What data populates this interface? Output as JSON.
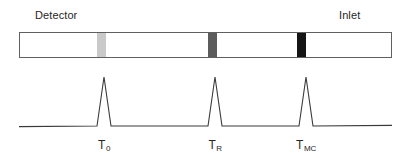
{
  "figure": {
    "background": "#ffffff"
  },
  "annotations": {
    "detector_label": "Detector",
    "inlet_label": "Inlet"
  },
  "column": {
    "name": "chromatographic-column",
    "border_color": "#606060",
    "fill_color": "#ffffff",
    "bands": [
      {
        "id": "band-t0",
        "label": "unretained band",
        "color": "#c9c9c9",
        "x_start_px": 97,
        "x_end_px": 106,
        "width_px": 9
      },
      {
        "id": "band-tr",
        "label": "retained analyte band",
        "color": "#5c5c5c",
        "x_start_px": 208,
        "x_end_px": 217,
        "width_px": 9
      },
      {
        "id": "band-tmc",
        "label": "most retained band",
        "color": "#151515",
        "x_start_px": 297,
        "x_end_px": 306,
        "width_px": 9
      }
    ]
  },
  "chart_data": {
    "type": "line",
    "title": "",
    "xlabel": "",
    "ylabel": "",
    "grid": false,
    "legend": null,
    "axis_visible": false,
    "line_color": "#3a3a3a",
    "baseline_y_px": 126,
    "x_range_px": [
      19,
      392
    ],
    "series": [
      {
        "name": "detector signal",
        "peaks": [
          {
            "label": "T0",
            "tick_text": "T",
            "tick_sub": "0",
            "center_px": 104,
            "apex_y_px": 77,
            "half_width_px": 7,
            "height_px": 49
          },
          {
            "label": "TR",
            "tick_text": "T",
            "tick_sub": "R",
            "center_px": 215,
            "apex_y_px": 77,
            "half_width_px": 7,
            "height_px": 49
          },
          {
            "label": "TMC",
            "tick_text": "T",
            "tick_sub": "MC",
            "center_px": 306,
            "apex_y_px": 77,
            "half_width_px": 7,
            "height_px": 49
          }
        ]
      }
    ],
    "x_tick_labels": [
      "T0",
      "TR",
      "TMC"
    ],
    "annotations": [
      "Detector",
      "Inlet"
    ]
  }
}
